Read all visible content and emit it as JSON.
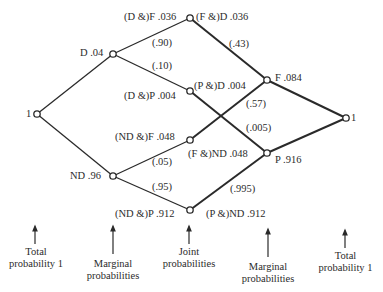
{
  "diagram": {
    "type": "probability-tree",
    "root": {
      "label": "1"
    },
    "end": {
      "label": "1"
    },
    "first_level": [
      {
        "id": "D",
        "label": "D .04"
      },
      {
        "id": "ND",
        "label": "ND .96"
      }
    ],
    "joint_left": [
      {
        "id": "DF",
        "label": "(D &)F .036"
      },
      {
        "id": "DP",
        "label": "(D &)P .004"
      },
      {
        "id": "NDF",
        "label": "(ND &)F .048"
      },
      {
        "id": "NDP",
        "label": "(ND &)P .912"
      }
    ],
    "joint_right": [
      {
        "id": "FD",
        "label": "(F &)D .036"
      },
      {
        "id": "PD",
        "label": "(P &)D .004"
      },
      {
        "id": "FND",
        "label": "(F &)ND .048"
      },
      {
        "id": "PND",
        "label": "(P &)ND .912"
      }
    ],
    "second_level_right": [
      {
        "id": "F",
        "label": "F .084"
      },
      {
        "id": "P",
        "label": "P .916"
      }
    ],
    "conditional_left": [
      {
        "from": "D",
        "to": "DF",
        "label": "(.90)"
      },
      {
        "from": "D",
        "to": "DP",
        "label": "(.10)"
      },
      {
        "from": "ND",
        "to": "NDF",
        "label": "(.05)"
      },
      {
        "from": "ND",
        "to": "NDP",
        "label": "(.95)"
      }
    ],
    "conditional_right": [
      {
        "from": "F",
        "to": "FD",
        "label": "(.43)"
      },
      {
        "from": "F",
        "to": "FND",
        "label": "(.57)"
      },
      {
        "from": "P",
        "to": "PD",
        "label": "(.005)"
      },
      {
        "from": "P",
        "to": "PND",
        "label": "(.995)"
      }
    ]
  },
  "captions": [
    {
      "line1": "Total",
      "line2": "probability 1"
    },
    {
      "line1": "Marginal",
      "line2": "probabilities"
    },
    {
      "line1": "Joint",
      "line2": "probabilities"
    },
    {
      "line1": "Marginal",
      "line2": "probabilities"
    },
    {
      "line1": "Total",
      "line2": "probability 1"
    }
  ]
}
